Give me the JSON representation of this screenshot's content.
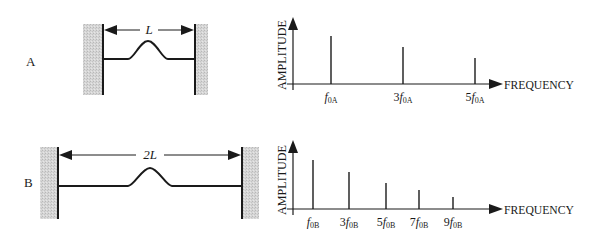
{
  "colors": {
    "ink": "#1a1a1a",
    "wall": "#cfcfcf"
  },
  "panels": [
    {
      "id": "A",
      "label": "A",
      "label_pos": [
        26,
        66
      ],
      "diagram": {
        "length_label": "L",
        "left_wall": {
          "gray": [
            83,
            103
          ],
          "line_x": 103
        },
        "right_wall": {
          "gray": [
            195,
            208
          ],
          "line_x": 195
        },
        "wall_y": [
          24,
          95
        ],
        "arrow_y": 30,
        "string_y": 59,
        "bump": {
          "start": 128,
          "peak_x": 148,
          "end": 168,
          "peak_y": 41
        }
      },
      "spectrum": {
        "y_axis_label": "AMPLITUDE",
        "x_axis_label": "FREQUENCY",
        "axis_x": 293,
        "axis_top": 17,
        "baseline": 84,
        "arrow_end": 503,
        "harmonics": [
          {
            "x": 331,
            "top": 36,
            "mult": "",
            "base": "f",
            "sub": "0A"
          },
          {
            "x": 403,
            "top": 47,
            "mult": "3",
            "base": "f",
            "sub": "0A"
          },
          {
            "x": 475,
            "top": 58,
            "mult": "5",
            "base": "f",
            "sub": "0A"
          }
        ]
      }
    },
    {
      "id": "B",
      "label": "B",
      "label_pos": [
        24,
        187
      ],
      "diagram": {
        "length_label": "2L",
        "left_wall": {
          "gray": [
            40,
            58
          ],
          "line_x": 58
        },
        "right_wall": {
          "gray": [
            242,
            259
          ],
          "line_x": 242
        },
        "wall_y": [
          147,
          219
        ],
        "arrow_y": 155,
        "string_y": 186,
        "bump": {
          "start": 128,
          "peak_x": 150,
          "end": 172,
          "peak_y": 168
        }
      },
      "spectrum": {
        "y_axis_label": "AMPLITUDE",
        "x_axis_label": "FREQUENCY",
        "axis_x": 293,
        "axis_top": 140,
        "baseline": 209,
        "arrow_end": 503,
        "harmonics": [
          {
            "x": 313,
            "top": 160,
            "mult": "",
            "base": "f",
            "sub": "0B"
          },
          {
            "x": 349,
            "top": 172,
            "mult": "3",
            "base": "f",
            "sub": "0B"
          },
          {
            "x": 386,
            "top": 183,
            "mult": "5",
            "base": "f",
            "sub": "0B"
          },
          {
            "x": 419,
            "top": 190,
            "mult": "7",
            "base": "f",
            "sub": "0B"
          },
          {
            "x": 453,
            "top": 197,
            "mult": "9",
            "base": "f",
            "sub": "0B"
          }
        ]
      }
    }
  ]
}
